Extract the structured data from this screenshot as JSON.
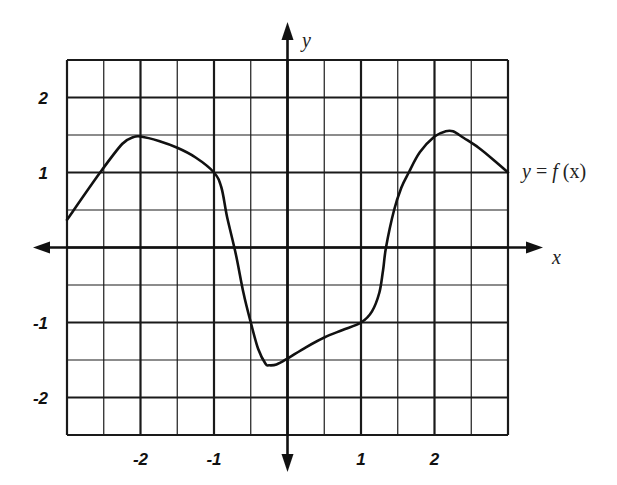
{
  "chart_data": {
    "type": "line",
    "title": "",
    "xlabel": "x",
    "ylabel": "y",
    "function_label": "y = f (x)",
    "xlim": [
      -3,
      3
    ],
    "ylim": [
      -2.5,
      2.5
    ],
    "grid": true,
    "grid_minor_step": 0.5,
    "grid_major_step": 1,
    "x_ticks": [
      -2,
      -1,
      1,
      2
    ],
    "x_tick_labels": [
      "-2",
      "-1",
      "1",
      "2"
    ],
    "y_ticks": [
      2,
      1,
      -1,
      -2
    ],
    "y_tick_labels": [
      "2",
      "1",
      "-1",
      "-2"
    ],
    "series": [
      {
        "name": "f(x)",
        "x": [
          -3,
          -2.55,
          -2.25,
          -2.1,
          -2,
          -1.75,
          -1.5,
          -1.25,
          -1,
          -0.9,
          -0.82,
          -0.7,
          -0.6,
          -0.5,
          -0.4,
          -0.3,
          -0.25,
          -0.15,
          0,
          0.25,
          0.5,
          0.75,
          1,
          1.15,
          1.25,
          1.3,
          1.34,
          1.45,
          1.55,
          1.65,
          1.8,
          2,
          2.15,
          2.25,
          2.4,
          2.6,
          2.8,
          3
        ],
        "y": [
          0.37,
          1.0,
          1.38,
          1.47,
          1.48,
          1.42,
          1.33,
          1.2,
          1.0,
          0.8,
          0.4,
          -0.1,
          -0.6,
          -1.0,
          -1.35,
          -1.55,
          -1.57,
          -1.56,
          -1.48,
          -1.33,
          -1.2,
          -1.1,
          -1.0,
          -0.85,
          -0.6,
          -0.3,
          0.0,
          0.5,
          0.8,
          1.0,
          1.27,
          1.48,
          1.55,
          1.55,
          1.46,
          1.33,
          1.17,
          1.0
        ]
      }
    ]
  },
  "labels": {
    "x_axis": "x",
    "y_axis": "y",
    "function": {
      "y": "y",
      "eq": " = ",
      "f": "f",
      "arg": " (x)"
    }
  }
}
